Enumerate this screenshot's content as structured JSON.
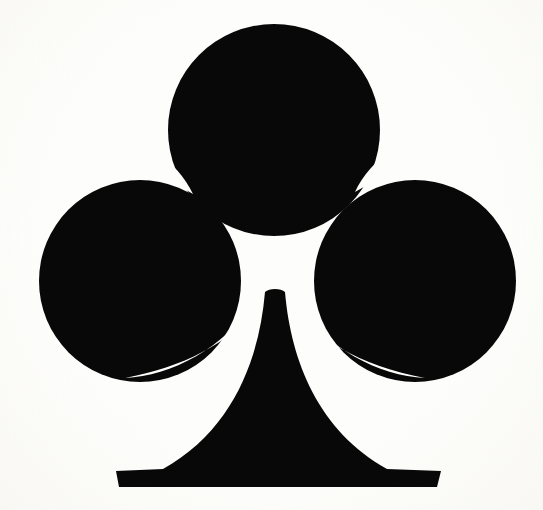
{
  "image": {
    "title": "Club suit symbol",
    "subject": "club-suit-pip",
    "description": "Solid black playing-card club (clover) suit symbol centered on an off-white scanned paper background",
    "width": 543,
    "height": 510,
    "orientation": "upright",
    "style": "silhouette",
    "unicode_glyph": "♣",
    "suit_name": "Clubs",
    "colors": {
      "figure": "#080808",
      "background": "#fdfdfb",
      "paper_tint": "#f6f5f1"
    },
    "geometry": {
      "top_lobe": {
        "cx": 274,
        "cy": 130,
        "r": 106
      },
      "left_lobe": {
        "cx": 140,
        "cy": 281,
        "r": 101
      },
      "right_lobe": {
        "cx": 415,
        "cy": 281,
        "r": 101
      },
      "notch_left_tip": {
        "x": 193,
        "y": 194
      },
      "notch_right_tip": {
        "x": 355,
        "y": 192
      },
      "stem_apex": {
        "x": 275,
        "y": 292
      },
      "foot": {
        "left": 116,
        "right": 441,
        "top": 466,
        "bottom": 487
      }
    },
    "path": "M 274 24 C 216 24 168 72 168 130 C 168 160 181 187 202 205 C 199 200 196 196 193 194 C 189 190 183 186 176 183 C 165 180 153 178 140 178 C 84 178 39 224 39 281 C 39 338 84 384 140 384 C 185 384 223 354 236 313 C 250 304 262 299 271 295 C 268 330 262 372 250 402 C 240 428 224 450 200 462 C 180 470 150 471 116 471 L 119 487 L 441 487 L 437 471 C 403 471 374 470 354 462 C 330 450 314 428 304 402 C 292 372 286 330 283 295 C 292 299 304 304 318 313 C 331 354 369 384 415 384 C 471 384 516 338 516 281 C 516 224 471 178 415 178 C 401 178 389 180 378 183 C 371 186 365 190 361 194 C 358 196 355 200 352 205 C 373 187 386 160 386 130 C 386 72 338 24 280 24 Z"
  }
}
